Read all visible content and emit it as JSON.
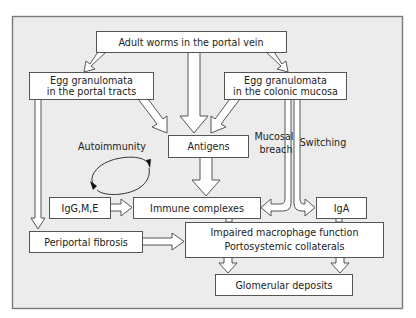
{
  "diagram": {
    "frame_fill": "#ececec",
    "nodes": {
      "adult_worms": "Adult worms in the portal vein",
      "egg_portal_line1": "Egg granulomata",
      "egg_portal_line2": "in the portal tracts",
      "egg_colonic_line1": "Egg granulomata",
      "egg_colonic_line2": "in the colonic mucosa",
      "antigens": "Antigens",
      "igg": "IgG,M,E",
      "immune_complexes": "Immune complexes",
      "iga": "IgA",
      "periportal_fibrosis": "Periportal fibrosis",
      "impaired_line1": "Impaired macrophage function",
      "impaired_line2": "Portosystemic collaterals",
      "glomerular": "Glomerular deposits"
    },
    "labels": {
      "autoimmunity": "Autoimmunity",
      "mucosal_line1": "Mucosal",
      "mucosal_line2": "breach",
      "switching": "Switching"
    }
  }
}
